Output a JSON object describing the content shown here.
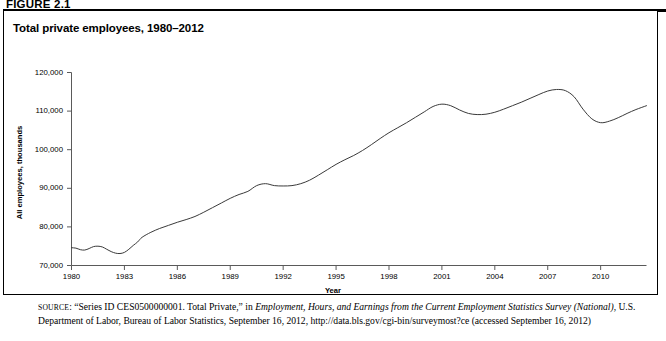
{
  "figure": {
    "number_label": "FIGURE 2.1",
    "title": "Total private employees, 1980–2012"
  },
  "source": {
    "prefix": "source",
    "colon": ": ",
    "part1": "“Series ID CES0500000001. Total Private,” in ",
    "italic1": "Employment, Hours, and Earnings from the Current Employment Statistics Survey (National)",
    "part2": ", U.S. Department of Labor, Bureau of Labor Statistics, September 16, 2012, http://data.bls.gov/cgi-bin/surveymost?ce (accessed September 16, 2012)"
  },
  "chart_data": {
    "type": "line",
    "title": "Total private employees, 1980–2012",
    "xlabel": "Year",
    "ylabel": "All employees, thousands",
    "xlim": [
      1980,
      2012.6
    ],
    "ylim": [
      70000,
      120000
    ],
    "grid": false,
    "legend": "none",
    "line_color": "#3a3a3a",
    "xticks": [
      1980,
      1983,
      1986,
      1989,
      1992,
      1995,
      1998,
      2001,
      2004,
      2007,
      2010
    ],
    "xtick_labels": [
      "1980",
      "1983",
      "1986",
      "1989",
      "1992",
      "1995",
      "1998",
      "2001",
      "2004",
      "2007",
      "2010"
    ],
    "yticks": [
      70000,
      80000,
      90000,
      100000,
      110000,
      120000
    ],
    "ytick_labels": [
      "70,000",
      "80,000",
      "90,000",
      "100,000",
      "110,000",
      "120,000"
    ],
    "series": [
      {
        "name": "Total private employees",
        "x": [
          1980.0,
          1980.25,
          1980.5,
          1980.75,
          1981.0,
          1981.25,
          1981.5,
          1981.75,
          1982.0,
          1982.25,
          1982.5,
          1982.75,
          1983.0,
          1983.25,
          1983.5,
          1983.75,
          1984.0,
          1984.5,
          1985.0,
          1985.5,
          1986.0,
          1986.5,
          1987.0,
          1987.5,
          1988.0,
          1988.5,
          1989.0,
          1989.5,
          1990.0,
          1990.5,
          1991.0,
          1991.5,
          1992.0,
          1992.5,
          1993.0,
          1993.5,
          1994.0,
          1994.5,
          1995.0,
          1995.5,
          1996.0,
          1996.5,
          1997.0,
          1997.5,
          1998.0,
          1998.5,
          1999.0,
          1999.5,
          2000.0,
          2000.5,
          2001.0,
          2001.5,
          2002.0,
          2002.5,
          2003.0,
          2003.5,
          2004.0,
          2004.5,
          2005.0,
          2005.5,
          2006.0,
          2006.5,
          2007.0,
          2007.5,
          2008.0,
          2008.5,
          2009.0,
          2009.5,
          2010.0,
          2010.5,
          2011.0,
          2011.5,
          2012.0,
          2012.6
        ],
        "y": [
          74600,
          74500,
          74100,
          74000,
          74400,
          74900,
          75000,
          74800,
          74200,
          73600,
          73200,
          73100,
          73400,
          74200,
          75200,
          76100,
          77300,
          78600,
          79600,
          80400,
          81200,
          81900,
          82700,
          83800,
          85000,
          86200,
          87400,
          88400,
          89200,
          90700,
          91200,
          90700,
          90600,
          90700,
          91200,
          92100,
          93400,
          94800,
          96200,
          97400,
          98500,
          99800,
          101300,
          102900,
          104400,
          105700,
          107000,
          108400,
          109800,
          111200,
          111800,
          111400,
          110300,
          109400,
          109100,
          109200,
          109700,
          110500,
          111400,
          112300,
          113300,
          114300,
          115200,
          115600,
          115300,
          113700,
          110500,
          108000,
          107000,
          107400,
          108300,
          109400,
          110400,
          111400
        ]
      }
    ]
  },
  "axes": {
    "y_axis_title": "All employees, thousands",
    "x_axis_title": "Year"
  }
}
